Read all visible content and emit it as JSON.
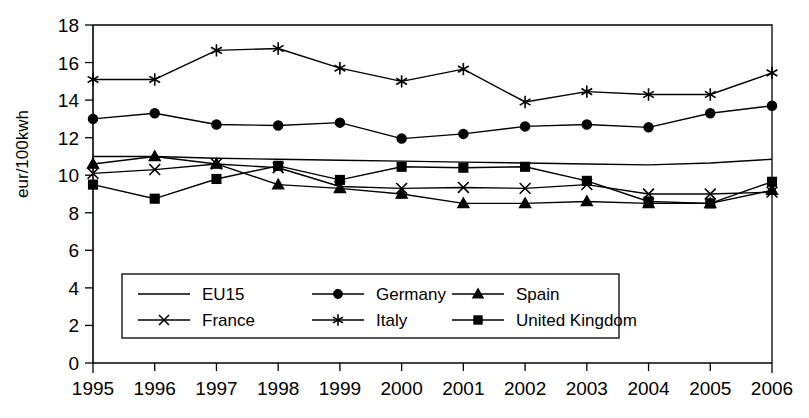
{
  "chart_data": {
    "type": "line",
    "title": "",
    "xlabel": "",
    "ylabel": "eur/100kwh",
    "grid": false,
    "legend_position": "inside-lower-left",
    "x": [
      1995,
      1996,
      1997,
      1998,
      1999,
      2000,
      2001,
      2002,
      2003,
      2004,
      2005,
      2006
    ],
    "categories": [
      "1995",
      "1996",
      "1997",
      "1998",
      "1999",
      "2000",
      "2001",
      "2002",
      "2003",
      "2004",
      "2005",
      "2006"
    ],
    "xlim": [
      1995,
      2006
    ],
    "ylim": [
      0,
      18
    ],
    "yticks": [
      0,
      2,
      4,
      6,
      8,
      10,
      12,
      14,
      16,
      18
    ],
    "ytick_labels": [
      "0",
      "2",
      "4",
      "6",
      "8",
      "10",
      "12",
      "14",
      "16",
      "18"
    ],
    "series": [
      {
        "name": "EU15",
        "marker": "none",
        "values": [
          11.0,
          11.0,
          10.9,
          10.85,
          10.8,
          10.75,
          10.7,
          10.65,
          10.6,
          10.55,
          10.65,
          10.85
        ]
      },
      {
        "name": "Germany",
        "marker": "circle",
        "values": [
          13.0,
          13.3,
          12.7,
          12.65,
          12.8,
          11.95,
          12.2,
          12.6,
          12.7,
          12.55,
          13.3,
          13.7
        ]
      },
      {
        "name": "Spain",
        "marker": "triangle",
        "values": [
          10.6,
          11.0,
          10.6,
          9.5,
          9.3,
          9.0,
          8.5,
          8.5,
          8.6,
          8.5,
          8.5,
          9.2
        ]
      },
      {
        "name": "France",
        "marker": "x",
        "values": [
          10.1,
          10.3,
          10.6,
          10.4,
          9.4,
          9.3,
          9.35,
          9.3,
          9.5,
          9.0,
          9.0,
          9.1
        ]
      },
      {
        "name": "Italy",
        "marker": "asterisk",
        "values": [
          15.1,
          15.1,
          16.65,
          16.75,
          15.7,
          15.0,
          15.65,
          13.9,
          14.45,
          14.3,
          14.3,
          15.45
        ]
      },
      {
        "name": "United Kingdom",
        "marker": "square",
        "values": [
          9.5,
          8.75,
          9.8,
          10.5,
          9.75,
          10.45,
          10.4,
          10.45,
          9.7,
          8.6,
          8.5,
          9.65
        ]
      }
    ]
  },
  "legend": {
    "entries": [
      {
        "label": "EU15",
        "marker": "none"
      },
      {
        "label": "Germany",
        "marker": "circle"
      },
      {
        "label": "Spain",
        "marker": "triangle"
      },
      {
        "label": "France",
        "marker": "x"
      },
      {
        "label": "Italy",
        "marker": "asterisk"
      },
      {
        "label": "United Kingdom",
        "marker": "square"
      }
    ]
  },
  "colors": {
    "ink": "#000000",
    "background": "#ffffff"
  }
}
